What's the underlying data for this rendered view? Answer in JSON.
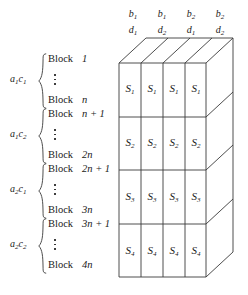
{
  "figure": {
    "type": "block-design-diagram",
    "line_color": "#3a3a3a",
    "background": "#ffffff",
    "column_headers": [
      {
        "top": "b",
        "top_sub": "1",
        "bottom": "d",
        "bottom_sub": "1"
      },
      {
        "top": "b",
        "top_sub": "1",
        "bottom": "d",
        "bottom_sub": "2"
      },
      {
        "top": "b",
        "top_sub": "2",
        "bottom": "d",
        "bottom_sub": "1"
      },
      {
        "top": "b",
        "top_sub": "2",
        "bottom": "d",
        "bottom_sub": "2"
      }
    ],
    "row_groups": [
      {
        "label_a": "a",
        "label_a_sub": "1",
        "label_c": "c",
        "label_c_sub": "1",
        "block_word": "Block",
        "first_index": "1",
        "last_index": "n",
        "cell": "S",
        "cell_sub": "1"
      },
      {
        "label_a": "a",
        "label_a_sub": "1",
        "label_c": "c",
        "label_c_sub": "2",
        "block_word": "Block",
        "first_index": "n + 1",
        "last_index": "2n",
        "cell": "S",
        "cell_sub": "2"
      },
      {
        "label_a": "a",
        "label_a_sub": "2",
        "label_c": "c",
        "label_c_sub": "1",
        "block_word": "Block",
        "first_index": "2n + 1",
        "last_index": "3n",
        "cell": "S",
        "cell_sub": "3"
      },
      {
        "label_a": "a",
        "label_a_sub": "2",
        "label_c": "c",
        "label_c_sub": "2",
        "block_word": "Block",
        "first_index": "3n + 1",
        "last_index": "4n",
        "cell": "S",
        "cell_sub": "4"
      }
    ],
    "ellipsis": "vertical-dots"
  }
}
